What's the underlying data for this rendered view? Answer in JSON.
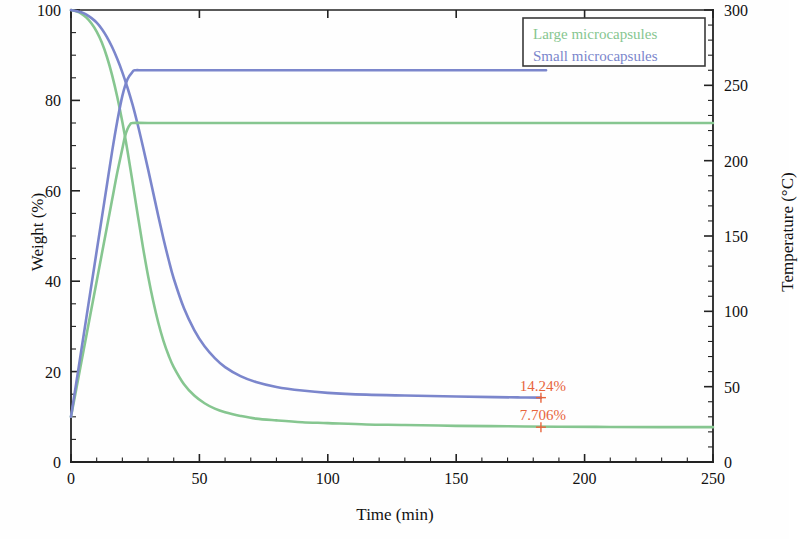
{
  "chart_data": {
    "type": "line",
    "title": "",
    "xlabel": "Time (min)",
    "ylabel": "Weight (%)",
    "y2label": "Temperature (°C)",
    "xlim": [
      0,
      250
    ],
    "ylim": [
      0,
      100
    ],
    "y2lim": [
      0,
      300
    ],
    "xticks": [
      0,
      50,
      100,
      150,
      200,
      250
    ],
    "yticks": [
      0,
      20,
      40,
      60,
      80,
      100
    ],
    "y2ticks": [
      0,
      50,
      100,
      150,
      200,
      250,
      300
    ],
    "xtick_labels": [
      "0",
      "50",
      "100",
      "150",
      "200",
      "250"
    ],
    "ytick_labels": [
      "0",
      "20",
      "40",
      "60",
      "80",
      "100"
    ],
    "y2tick_labels": [
      "0",
      "50",
      "100",
      "150",
      "200",
      "250",
      "300"
    ],
    "grid": false,
    "legend_position": "top-right",
    "minor_ticks": true,
    "colors": {
      "large_microcapsules": "#86c690",
      "small_microcapsules": "#7b86cc",
      "annotation": "#e8643c",
      "axis": "#222222"
    },
    "series": [
      {
        "name": "Large microcapsules weight",
        "legend": "Large microcapsules",
        "axis": "left",
        "color": "#86c690",
        "units": "%",
        "points": [
          [
            0,
            100.0
          ],
          [
            2,
            99.7
          ],
          [
            4,
            99.2
          ],
          [
            6,
            98.3
          ],
          [
            8,
            97.0
          ],
          [
            10,
            95.2
          ],
          [
            12,
            92.8
          ],
          [
            14,
            89.6
          ],
          [
            16,
            85.6
          ],
          [
            18,
            80.8
          ],
          [
            20,
            75.2
          ],
          [
            22,
            68.8
          ],
          [
            24,
            61.8
          ],
          [
            26,
            54.6
          ],
          [
            28,
            47.6
          ],
          [
            30,
            41.2
          ],
          [
            32,
            35.6
          ],
          [
            34,
            30.8
          ],
          [
            36,
            26.8
          ],
          [
            38,
            23.6
          ],
          [
            40,
            21.0
          ],
          [
            44,
            17.2
          ],
          [
            48,
            14.7
          ],
          [
            52,
            13.0
          ],
          [
            56,
            11.8
          ],
          [
            60,
            11.0
          ],
          [
            66,
            10.2
          ],
          [
            72,
            9.6
          ],
          [
            80,
            9.2
          ],
          [
            90,
            8.8
          ],
          [
            100,
            8.6
          ],
          [
            115,
            8.3
          ],
          [
            130,
            8.2
          ],
          [
            150,
            8.0
          ],
          [
            170,
            7.9
          ],
          [
            190,
            7.8
          ],
          [
            210,
            7.75
          ],
          [
            230,
            7.72
          ],
          [
            250,
            7.706
          ]
        ]
      },
      {
        "name": "Small microcapsules weight",
        "legend": "Small microcapsules",
        "axis": "left",
        "color": "#7b86cc",
        "units": "%",
        "points": [
          [
            0,
            100.0
          ],
          [
            2,
            99.8
          ],
          [
            4,
            99.5
          ],
          [
            6,
            99.0
          ],
          [
            8,
            98.2
          ],
          [
            10,
            97.2
          ],
          [
            12,
            95.8
          ],
          [
            14,
            94.0
          ],
          [
            16,
            91.8
          ],
          [
            18,
            89.2
          ],
          [
            20,
            86.2
          ],
          [
            22,
            82.8
          ],
          [
            24,
            79.0
          ],
          [
            26,
            74.6
          ],
          [
            28,
            69.8
          ],
          [
            30,
            64.8
          ],
          [
            32,
            59.6
          ],
          [
            34,
            54.4
          ],
          [
            36,
            49.4
          ],
          [
            38,
            44.8
          ],
          [
            40,
            40.6
          ],
          [
            44,
            34.0
          ],
          [
            48,
            29.2
          ],
          [
            52,
            25.6
          ],
          [
            56,
            23.0
          ],
          [
            60,
            21.0
          ],
          [
            66,
            19.0
          ],
          [
            72,
            17.7
          ],
          [
            80,
            16.6
          ],
          [
            90,
            15.8
          ],
          [
            100,
            15.3
          ],
          [
            115,
            14.9
          ],
          [
            130,
            14.7
          ],
          [
            150,
            14.5
          ],
          [
            165,
            14.35
          ],
          [
            175,
            14.28
          ],
          [
            183,
            14.24
          ]
        ]
      },
      {
        "name": "Large microcapsules temperature",
        "axis": "right",
        "color": "#86c690",
        "units": "°C",
        "points": [
          [
            0,
            30
          ],
          [
            2,
            48
          ],
          [
            4,
            66
          ],
          [
            6,
            84
          ],
          [
            8,
            102
          ],
          [
            10,
            120
          ],
          [
            12,
            138
          ],
          [
            14,
            156
          ],
          [
            16,
            174
          ],
          [
            18,
            192
          ],
          [
            20,
            208
          ],
          [
            21,
            216
          ],
          [
            22,
            221
          ],
          [
            23,
            224
          ],
          [
            24,
            225
          ],
          [
            30,
            225
          ],
          [
            50,
            225
          ],
          [
            80,
            225
          ],
          [
            120,
            225
          ],
          [
            160,
            225
          ],
          [
            200,
            225
          ],
          [
            230,
            225
          ],
          [
            250,
            225
          ]
        ]
      },
      {
        "name": "Small microcapsules temperature",
        "axis": "right",
        "color": "#7b86cc",
        "units": "°C",
        "points": [
          [
            0,
            30
          ],
          [
            2,
            52
          ],
          [
            4,
            74
          ],
          [
            6,
            96
          ],
          [
            8,
            118
          ],
          [
            10,
            140
          ],
          [
            12,
            162
          ],
          [
            14,
            184
          ],
          [
            16,
            206
          ],
          [
            18,
            226
          ],
          [
            20,
            243
          ],
          [
            22,
            254
          ],
          [
            24,
            259
          ],
          [
            25,
            260
          ],
          [
            30,
            260
          ],
          [
            50,
            260
          ],
          [
            80,
            260
          ],
          [
            120,
            260
          ],
          [
            150,
            260
          ],
          [
            170,
            260
          ],
          [
            185,
            260
          ]
        ]
      }
    ],
    "annotations": [
      {
        "text": "14.24%",
        "x": 183,
        "y": 14.24,
        "axis": "left",
        "color": "#e8643c",
        "marker": "+"
      },
      {
        "text": "7.706%",
        "x": 183,
        "y": 7.706,
        "axis": "left",
        "color": "#e8643c",
        "marker": "+"
      }
    ]
  },
  "legend": {
    "entries": [
      {
        "label": "Large microcapsules",
        "color": "#86c690"
      },
      {
        "label": "Small microcapsules",
        "color": "#7b86cc"
      }
    ]
  },
  "axes": {
    "xlabel": "Time (min)",
    "ylabel_left": "Weight (%)",
    "ylabel_right": "Temperature (°C)"
  }
}
